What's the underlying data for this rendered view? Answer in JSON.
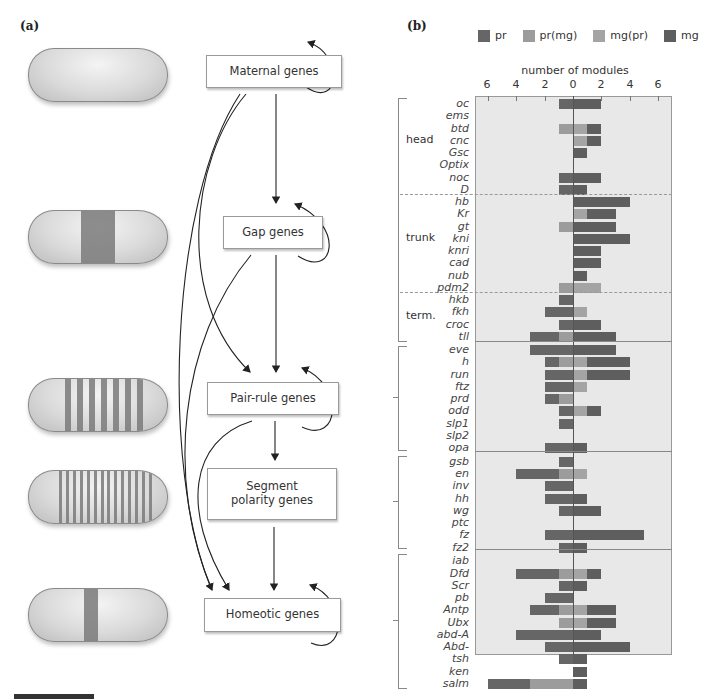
{
  "panel_a": {
    "label": "(a)",
    "boxes": [
      {
        "id": "maternal",
        "label": "Maternal genes"
      },
      {
        "id": "gap",
        "label": "Gap genes"
      },
      {
        "id": "pair_rule",
        "label": "Pair-rule genes"
      },
      {
        "id": "segment_polarity",
        "label": "Segment polarity genes"
      },
      {
        "id": "homeotic",
        "label": "Homeotic genes"
      }
    ],
    "embryos": [
      {
        "stage": "maternal",
        "stripes": 0
      },
      {
        "stage": "gap",
        "stripes": 1
      },
      {
        "stage": "pair_rule",
        "stripes": 7
      },
      {
        "stage": "segment_polarity",
        "stripes": 14
      },
      {
        "stage": "homeotic",
        "stripes": 1
      }
    ]
  },
  "panel_b": {
    "label": "(b)",
    "legend": [
      {
        "label": "pr",
        "color": "#666666"
      },
      {
        "label": "pr(mg)",
        "color": "#9c9c9c"
      },
      {
        "label": "mg(pr)",
        "color": "#a4a4a4"
      },
      {
        "label": "mg",
        "color": "#5e5e5e"
      }
    ],
    "axis_title": "number of modules",
    "ticks": [
      "6",
      "4",
      "2",
      "0",
      "2",
      "4",
      "6"
    ],
    "regions": [
      {
        "label": "head"
      },
      {
        "label": "trunk"
      },
      {
        "label": "term."
      }
    ]
  },
  "chart_data": {
    "type": "bar",
    "title": "number of modules",
    "orientation": "horizontal, diverging (pr left, mg right)",
    "xlabel": "number of modules",
    "xlim": [
      -7,
      7
    ],
    "tick_labels": [
      "6",
      "4",
      "2",
      "0",
      "2",
      "4",
      "6"
    ],
    "legend": [
      "pr",
      "pr(mg)",
      "mg(pr)",
      "mg"
    ],
    "groups": [
      {
        "name": "maternal/gap head",
        "region": "head",
        "genes": [
          "oc",
          "ems",
          "btd",
          "cnc",
          "Gsc",
          "Optix",
          "noc",
          "D"
        ]
      },
      {
        "name": "maternal/gap trunk",
        "region": "trunk",
        "genes": [
          "hb",
          "Kr",
          "gt",
          "kni",
          "knri",
          "cad",
          "nub",
          "pdm2"
        ]
      },
      {
        "name": "maternal/gap terminal",
        "region": "term.",
        "genes": [
          "hkb",
          "fkh",
          "croc",
          "tll"
        ]
      },
      {
        "name": "pair-rule",
        "region": "",
        "genes": [
          "eve",
          "h",
          "run",
          "ftz",
          "prd",
          "odd",
          "slp1",
          "slp2",
          "opa"
        ]
      },
      {
        "name": "segment polarity",
        "region": "",
        "genes": [
          "gsb",
          "en",
          "inv",
          "hh",
          "wg",
          "ptc",
          "fz",
          "fz2"
        ]
      },
      {
        "name": "homeotic",
        "region": "",
        "genes": [
          "iab",
          "Dfd",
          "Scr",
          "pb",
          "Antp",
          "Ubx",
          "abd-A",
          "Abd-",
          "tsh",
          "ken",
          "salm"
        ]
      }
    ],
    "categories": [
      "oc",
      "ems",
      "btd",
      "cnc",
      "Gsc",
      "Optix",
      "noc",
      "D",
      "hb",
      "Kr",
      "gt",
      "kni",
      "knri",
      "cad",
      "nub",
      "pdm2",
      "hkb",
      "fkh",
      "croc",
      "tll",
      "eve",
      "h",
      "run",
      "ftz",
      "prd",
      "odd",
      "slp1",
      "slp2",
      "opa",
      "gsb",
      "en",
      "inv",
      "hh",
      "wg",
      "ptc",
      "fz",
      "fz2",
      "iab",
      "Dfd",
      "Scr",
      "pb",
      "Antp",
      "Ubx",
      "abd-A",
      "Abd-",
      "tsh",
      "ken",
      "salm"
    ],
    "series": [
      {
        "name": "pr",
        "values": [
          1,
          0,
          0,
          0,
          0,
          0,
          1,
          1,
          0,
          0,
          0,
          0,
          0,
          0,
          0,
          0,
          1,
          2,
          1,
          2,
          3,
          1,
          2,
          2,
          1,
          1,
          1,
          0,
          2,
          1,
          3,
          2,
          2,
          1,
          0,
          2,
          1,
          0,
          3,
          1,
          2,
          2,
          0,
          4,
          2,
          1,
          0,
          3
        ]
      },
      {
        "name": "pr(mg)",
        "values": [
          0,
          0,
          1,
          0,
          0,
          0,
          0,
          0,
          0,
          0,
          1,
          0,
          0,
          0,
          0,
          1,
          0,
          0,
          0,
          1,
          0,
          1,
          0,
          0,
          1,
          0,
          0,
          0,
          0,
          0,
          1,
          0,
          0,
          0,
          0,
          0,
          0,
          0,
          1,
          0,
          0,
          1,
          1,
          0,
          0,
          0,
          0,
          3
        ]
      },
      {
        "name": "mg(pr)",
        "values": [
          0,
          0,
          1,
          1,
          0,
          0,
          0,
          0,
          0,
          1,
          0,
          0,
          0,
          0,
          0,
          2,
          0,
          1,
          0,
          0,
          0,
          1,
          1,
          1,
          0,
          1,
          0,
          0,
          0,
          0,
          1,
          0,
          0,
          0,
          0,
          0,
          0,
          0,
          1,
          0,
          0,
          1,
          1,
          0,
          0,
          0,
          0,
          0
        ]
      },
      {
        "name": "mg",
        "values": [
          2,
          0,
          1,
          1,
          1,
          0,
          2,
          1,
          4,
          2,
          3,
          4,
          2,
          2,
          1,
          0,
          0,
          0,
          2,
          3,
          3,
          3,
          3,
          0,
          0,
          1,
          0,
          0,
          1,
          0,
          0,
          0,
          1,
          2,
          0,
          5,
          1,
          0,
          1,
          1,
          0,
          2,
          2,
          2,
          4,
          1,
          1,
          1
        ]
      }
    ],
    "grid": false,
    "legend_position": "top"
  }
}
